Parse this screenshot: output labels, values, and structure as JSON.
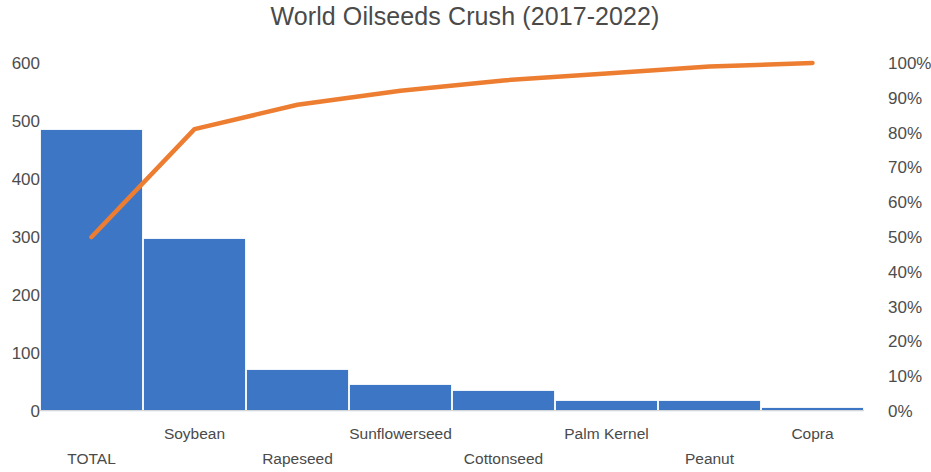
{
  "chart_data": {
    "type": "bar",
    "title": "World Oilseeds Crush (2017-2022)",
    "xlabel": "",
    "ylabel": "",
    "categories": [
      "TOTAL",
      "Soybean",
      "Rapeseed",
      "Sunflowerseed",
      "Cottonseed",
      "Palm Kernel",
      "Peanut",
      "Copra"
    ],
    "series": [
      {
        "name": "Crush",
        "type": "bar",
        "axis": "left",
        "color": "#3E76C6",
        "values": [
          485,
          296,
          70,
          45,
          35,
          18,
          17,
          5
        ]
      },
      {
        "name": "Cumulative %",
        "type": "line",
        "axis": "right",
        "color": "#ED7D31",
        "values": [
          50,
          81,
          88,
          92,
          95,
          97,
          99,
          100
        ]
      }
    ],
    "ylim": [
      0,
      600
    ],
    "yticks": [
      600,
      500,
      400,
      300,
      200,
      100,
      0
    ],
    "y2lim": [
      0,
      100
    ],
    "y2ticks": [
      "100%",
      "90%",
      "80%",
      "70%",
      "60%",
      "50%",
      "40%",
      "30%",
      "20%",
      "10%",
      "0%"
    ],
    "grid": false,
    "legend": "none"
  },
  "axes": {
    "left_ticks": [
      "600",
      "500",
      "400",
      "300",
      "200",
      "100",
      "0"
    ],
    "right_ticks": [
      "100%",
      "90%",
      "80%",
      "70%",
      "60%",
      "50%",
      "40%",
      "30%",
      "20%",
      "10%",
      "0%"
    ]
  },
  "x_labels": [
    {
      "label": "TOTAL",
      "row": "bot"
    },
    {
      "label": "Soybean",
      "row": "top"
    },
    {
      "label": "Rapeseed",
      "row": "bot"
    },
    {
      "label": "Sunflowerseed",
      "row": "top"
    },
    {
      "label": "Cottonseed",
      "row": "bot"
    },
    {
      "label": "Palm Kernel",
      "row": "top"
    },
    {
      "label": "Peanut",
      "row": "bot"
    },
    {
      "label": "Copra",
      "row": "top"
    }
  ],
  "colors": {
    "bar": "#3E76C6",
    "line": "#ED7D31",
    "text": "#4a4a4a",
    "background": "#ffffff"
  }
}
